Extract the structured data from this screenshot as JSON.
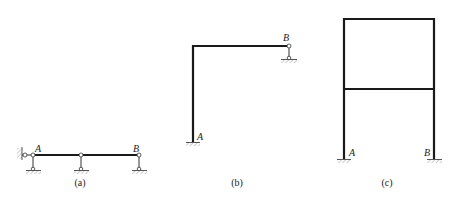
{
  "figures": [
    {
      "id": "a",
      "caption": "(a)",
      "labels": {
        "left": "A",
        "right": "B"
      },
      "description": "Continuous beam with fixed-pin wall support at left and three roller/link supports"
    },
    {
      "id": "b",
      "caption": "(b)",
      "labels": {
        "left": "A",
        "right": "B"
      },
      "description": "L-shaped frame, fixed at A, link support at B"
    },
    {
      "id": "c",
      "caption": "(c)",
      "labels": {
        "left": "A",
        "right": "B"
      },
      "description": "Two-storey single-bay portal frame fixed at A and B"
    }
  ],
  "colors": {
    "member": "#1a1a1a",
    "hatch": "#888888",
    "text": "#222222"
  }
}
